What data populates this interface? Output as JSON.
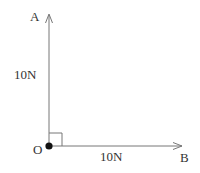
{
  "diagram": {
    "type": "force-vector-diagram",
    "origin": {
      "label": "O",
      "x": 49,
      "y": 146
    },
    "vectors": [
      {
        "id": "OA",
        "end_label": "A",
        "magnitude_label": "10N",
        "direction": "up",
        "end": {
          "x": 49,
          "y": 14
        }
      },
      {
        "id": "OB",
        "end_label": "B",
        "magnitude_label": "10N",
        "direction": "right",
        "end": {
          "x": 182,
          "y": 146
        }
      }
    ],
    "right_angle_marker": {
      "x": 49,
      "y": 133,
      "size": 13
    },
    "colors": {
      "line": "#777777",
      "point": "#111111",
      "text": "#333333"
    }
  },
  "labels": {
    "point_a": "A",
    "point_b": "B",
    "point_o": "O",
    "force_oa": "10N",
    "force_ob": "10N"
  }
}
